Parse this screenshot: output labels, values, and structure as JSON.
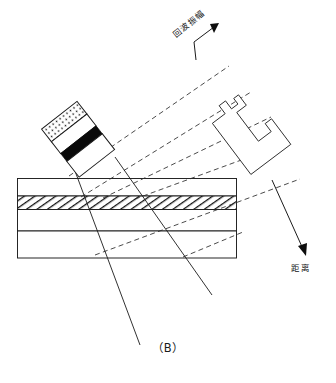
{
  "figure": {
    "panel_caption": "（B）",
    "axes": {
      "echo_amplitude_label": "回波振幅",
      "distance_label": "距离"
    },
    "probe": {
      "name": "angle-beam-probe",
      "segments": [
        {
          "id": "damping-backing",
          "fill": "dotted"
        },
        {
          "id": "upper-white-band",
          "fill": "white"
        },
        {
          "id": "piezo-element",
          "fill": "black"
        },
        {
          "id": "wedge",
          "fill": "white"
        }
      ],
      "rotation_deg": -38
    },
    "specimen": {
      "name": "layered-test-plate",
      "layers": [
        {
          "id": "top-layer",
          "fill": "white"
        },
        {
          "id": "flaw-layer",
          "fill": "hatched"
        },
        {
          "id": "mid-layer",
          "fill": "white"
        },
        {
          "id": "bottom-layer",
          "fill": "white"
        }
      ]
    },
    "beams": {
      "incident_count": 2,
      "reflected_dashed_count": 5
    },
    "waveform": {
      "name": "a-scan-echo-trace",
      "peak_count": 4
    }
  }
}
